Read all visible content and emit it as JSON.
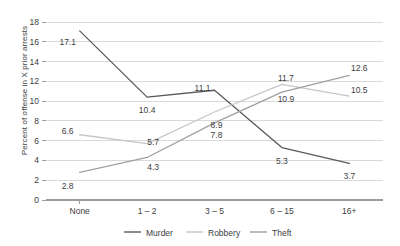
{
  "chart_data": {
    "type": "line",
    "title": "",
    "xlabel": "",
    "ylabel": "Percent of offense in X prior arrests",
    "categories": [
      "None",
      "1 – 2",
      "3 – 5",
      "6 – 15",
      "16+"
    ],
    "ylim": [
      0,
      18
    ],
    "yticks": [
      0,
      2,
      4,
      6,
      8,
      10,
      12,
      14,
      16,
      18
    ],
    "ytick_labels": [
      "0",
      "2",
      "4",
      "6",
      "8",
      "10",
      "12",
      "14",
      "16",
      "18"
    ],
    "grid": true,
    "legend_position": "bottom",
    "series": [
      {
        "name": "Murder",
        "color": "#595959",
        "values": [
          17.1,
          10.4,
          11.1,
          5.3,
          3.7
        ],
        "labels": [
          "17.1",
          "10.4",
          "11.1",
          "5.3",
          "3.7"
        ]
      },
      {
        "name": "Robbery",
        "color": "#c6c6c6",
        "values": [
          6.6,
          5.7,
          8.9,
          11.7,
          10.5
        ],
        "labels": [
          "6.6",
          "5.7",
          "8.9",
          "11.7",
          "10.5"
        ]
      },
      {
        "name": "Theft",
        "color": "#a0a0a0",
        "values": [
          2.8,
          4.3,
          7.8,
          10.9,
          12.6
        ],
        "labels": [
          "2.8",
          "4.3",
          "7.8",
          "10.9",
          "12.6"
        ]
      }
    ]
  },
  "legend": {
    "items": [
      {
        "label": "Murder"
      },
      {
        "label": "Robbery"
      },
      {
        "label": "Theft"
      }
    ]
  }
}
